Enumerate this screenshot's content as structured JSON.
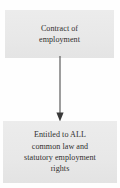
{
  "diagram": {
    "type": "flowchart",
    "orientation": "vertical",
    "background_color": "#fefefe",
    "node_fill_color": "#e9e9e9",
    "text_color": "#302f2e",
    "connector_color": "#4a4a4a",
    "nodes": [
      {
        "id": "contract",
        "label": "Contract of\nemployment",
        "shape": "rectangle"
      },
      {
        "id": "entitlement",
        "label": "Entitled to ALL\ncommon law and\nstatutory employment\nrights",
        "shape": "rectangle"
      }
    ],
    "edges": [
      {
        "id": "contract-to-entitlement",
        "from": "contract",
        "to": "entitlement",
        "style": "solid",
        "arrowhead": "filled-triangle",
        "label": ""
      }
    ]
  }
}
